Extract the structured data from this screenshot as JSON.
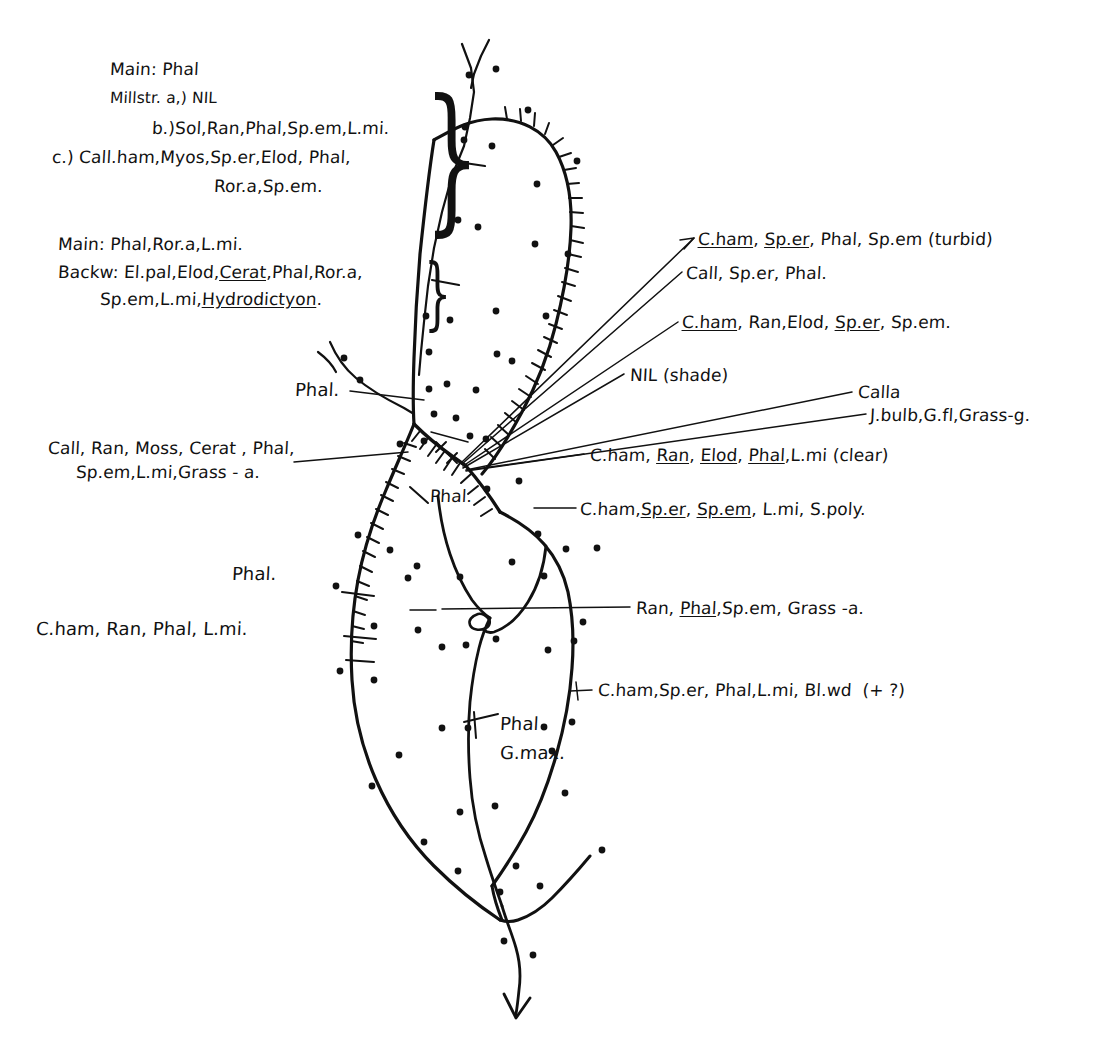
{
  "document": {
    "type": "hand-drawn field sketch",
    "subject": "river / watercourse vegetation survey map",
    "background_color": "#ffffff",
    "ink_color": "#111111"
  },
  "notes_blocks": {
    "upper_block": {
      "lines": [
        "Main: Phal",
        "Millstr. a,) NIL",
        "b.)Sol,Ran,Phal,Sp.em,L.mi.",
        "c.) Call.ham,Myos,Sp.er,Elod, Phal,",
        "Ror.a,Sp.em."
      ]
    },
    "lower_block": {
      "lines": [
        "Main: Phal,Ror.a,L.mi.",
        "Backw: El.pal,Elod,Cerat,Phal,Ror.a,",
        "Sp.em,L.mi,Hydrodictyon."
      ],
      "underlined_terms": [
        "Cerat",
        "Hydrodictyon"
      ]
    }
  },
  "right_annotations": [
    {
      "id": "ann-turbid",
      "text": "C.ham, Sp.er, Phal, Sp.em (turbid)",
      "underlined": [
        "C.ham",
        "Sp.er"
      ]
    },
    {
      "id": "ann-call",
      "text": "Call, Sp.er, Phal.",
      "underlined": []
    },
    {
      "id": "ann-cham-ran-elod",
      "text": "C.ham, Ran,Elod, Sp.er, Sp.em.",
      "underlined": [
        "C.ham",
        "Sp.er"
      ]
    },
    {
      "id": "ann-nil-shade",
      "text": "NIL (shade)",
      "underlined": []
    },
    {
      "id": "ann-calla",
      "text": "Calla",
      "underlined": []
    },
    {
      "id": "ann-jbulb",
      "text": "J.bulb,G.fl,Grass-g.",
      "underlined": []
    },
    {
      "id": "ann-clear",
      "text": "C.ham, Ran, Elod, Phal,L.mi (clear)",
      "underlined": [
        "Ran",
        "Elod",
        "Phal"
      ]
    },
    {
      "id": "ann-spoly",
      "text": "C.ham,Sp.er, Sp.em, L.mi, S.poly.",
      "underlined": [
        "Sp.er",
        "Sp.em"
      ]
    },
    {
      "id": "ann-grass-a",
      "text": "Ran, Phal,Sp.em, Grass -a.",
      "underlined": [
        "Phal"
      ]
    },
    {
      "id": "ann-blwd",
      "text": "C.ham,Sp.er, Phal,L.mi, Bl.wd  (+ ?)",
      "underlined": []
    }
  ],
  "left_annotations": [
    {
      "id": "ann-phal-upper",
      "text": "Phal."
    },
    {
      "id": "ann-call-ran-moss-1",
      "text": "Call, Ran, Moss, Cerat , Phal,"
    },
    {
      "id": "ann-call-ran-moss-2",
      "text": "Sp.em,L.mi,Grass - a."
    },
    {
      "id": "ann-phal-mid",
      "text": "Phal."
    },
    {
      "id": "ann-phal-lower",
      "text": "Phal."
    },
    {
      "id": "ann-cham-ran-phal",
      "text": "C.ham, Ran, Phal, L.mi."
    }
  ],
  "inline_annotations": [
    {
      "id": "ann-phal-gmax-1",
      "text": "Phal"
    },
    {
      "id": "ann-phal-gmax-2",
      "text": "G.max."
    }
  ],
  "map_marks": {
    "cross_marks": [
      "x",
      "x"
    ],
    "flow_arrow": "downstream outflow arrow at bottom",
    "hatching": "tick-marks along eastern river bank indicating steep bank / reed fringe",
    "stipple_dots": "marsh / wet-meadow stipple dots scattered across map"
  }
}
